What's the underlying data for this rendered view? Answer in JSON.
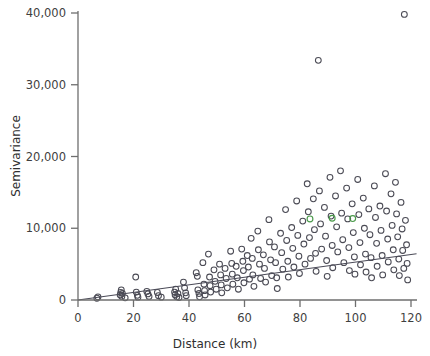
{
  "chart_data": {
    "type": "scatter",
    "title": "",
    "subtitle": "",
    "xlabel": "Distance (km)",
    "ylabel": "Semivariance",
    "xlim": [
      0,
      122
    ],
    "ylim": [
      0,
      41000
    ],
    "xticks": [
      0,
      20,
      40,
      60,
      80,
      100,
      120
    ],
    "xticklabels": [
      "0",
      "20",
      "40",
      "60",
      "80",
      "100",
      "120"
    ],
    "yticks": [
      0,
      10000,
      20000,
      30000,
      40000
    ],
    "yticklabels": [
      "0",
      "10,000",
      "20,000",
      "30,000",
      "40,000"
    ],
    "grid": false,
    "legend": null,
    "marker": "open-circle",
    "marker_size": 4.2,
    "colors": {
      "marker": "#4b4b55",
      "marker_highlight": "#4a9a4a",
      "trendline": "#4a4a57",
      "axis": "#6e6e6e",
      "text": "#3f3f3f",
      "background": "#ffffff"
    },
    "annotations": [
      {
        "label": "trend line",
        "type": "line",
        "x0": 0,
        "y0": 0,
        "x1": 122,
        "y1": 6450
      }
    ],
    "series": [
      {
        "name": "semivariance cloud",
        "color": "#4b4b55",
        "points": [
          [
            6.8,
            250
          ],
          [
            7.2,
            420
          ],
          [
            15.2,
            700
          ],
          [
            15.4,
            1050
          ],
          [
            15.6,
            1400
          ],
          [
            15.8,
            500
          ],
          [
            16.0,
            900
          ],
          [
            17.0,
            300
          ],
          [
            20.8,
            3200
          ],
          [
            21.0,
            1100
          ],
          [
            21.4,
            650
          ],
          [
            21.6,
            400
          ],
          [
            24.8,
            1200
          ],
          [
            25.2,
            850
          ],
          [
            25.6,
            500
          ],
          [
            28.6,
            1050
          ],
          [
            29.0,
            600
          ],
          [
            30.0,
            400
          ],
          [
            34.8,
            1100
          ],
          [
            35.0,
            700
          ],
          [
            35.2,
            1500
          ],
          [
            35.6,
            450
          ],
          [
            36.0,
            900
          ],
          [
            36.4,
            350
          ],
          [
            38.0,
            2500
          ],
          [
            38.4,
            1700
          ],
          [
            38.8,
            1000
          ],
          [
            39.0,
            600
          ],
          [
            42.6,
            3800
          ],
          [
            43.0,
            3300
          ],
          [
            43.2,
            1400
          ],
          [
            43.6,
            900
          ],
          [
            43.8,
            450
          ],
          [
            45.0,
            5200
          ],
          [
            45.4,
            2200
          ],
          [
            45.6,
            1300
          ],
          [
            45.8,
            700
          ],
          [
            47.0,
            6400
          ],
          [
            47.4,
            3200
          ],
          [
            47.6,
            2000
          ],
          [
            47.8,
            1100
          ],
          [
            49.0,
            4200
          ],
          [
            49.4,
            2600
          ],
          [
            49.8,
            1500
          ],
          [
            51.0,
            5000
          ],
          [
            51.4,
            3500
          ],
          [
            51.6,
            2100
          ],
          [
            51.8,
            1000
          ],
          [
            53.0,
            4400
          ],
          [
            53.4,
            3000
          ],
          [
            53.8,
            1700
          ],
          [
            55.0,
            6800
          ],
          [
            55.4,
            5100
          ],
          [
            55.6,
            3600
          ],
          [
            55.8,
            2200
          ],
          [
            57.0,
            4700
          ],
          [
            57.4,
            3100
          ],
          [
            57.8,
            1500
          ],
          [
            59.0,
            7100
          ],
          [
            59.4,
            5400
          ],
          [
            59.6,
            4100
          ],
          [
            59.8,
            2400
          ],
          [
            61.0,
            6200
          ],
          [
            61.4,
            4600
          ],
          [
            61.8,
            2900
          ],
          [
            62.4,
            8600
          ],
          [
            62.8,
            5800
          ],
          [
            63.0,
            3500
          ],
          [
            63.4,
            1900
          ],
          [
            64.8,
            9600
          ],
          [
            65.0,
            7000
          ],
          [
            65.4,
            5000
          ],
          [
            65.8,
            3000
          ],
          [
            66.8,
            6300
          ],
          [
            67.2,
            4400
          ],
          [
            67.6,
            2500
          ],
          [
            68.8,
            11200
          ],
          [
            69.0,
            8100
          ],
          [
            69.4,
            5600
          ],
          [
            69.8,
            3400
          ],
          [
            70.8,
            7400
          ],
          [
            71.2,
            5200
          ],
          [
            71.6,
            3100
          ],
          [
            71.8,
            1600
          ],
          [
            73.0,
            9300
          ],
          [
            73.4,
            6600
          ],
          [
            73.8,
            4300
          ],
          [
            74.8,
            12600
          ],
          [
            75.2,
            8300
          ],
          [
            75.6,
            5400
          ],
          [
            75.8,
            3200
          ],
          [
            77.0,
            10100
          ],
          [
            77.4,
            7200
          ],
          [
            77.8,
            4600
          ],
          [
            78.8,
            13800
          ],
          [
            79.2,
            9000
          ],
          [
            79.6,
            6100
          ],
          [
            79.8,
            3700
          ],
          [
            81.0,
            11000
          ],
          [
            81.4,
            7800
          ],
          [
            81.8,
            5000
          ],
          [
            82.6,
            16200
          ],
          [
            83.0,
            12300
          ],
          [
            83.4,
            8700
          ],
          [
            83.8,
            5800
          ],
          [
            84.8,
            14100
          ],
          [
            85.2,
            9800
          ],
          [
            85.6,
            6500
          ],
          [
            85.8,
            4000
          ],
          [
            86.6,
            33400
          ],
          [
            87.0,
            15200
          ],
          [
            87.4,
            10600
          ],
          [
            87.8,
            7100
          ],
          [
            88.8,
            12900
          ],
          [
            89.2,
            8900
          ],
          [
            89.6,
            5500
          ],
          [
            89.8,
            3300
          ],
          [
            90.8,
            17100
          ],
          [
            91.2,
            11700
          ],
          [
            91.6,
            7600
          ],
          [
            91.8,
            4500
          ],
          [
            92.8,
            14500
          ],
          [
            93.2,
            10200
          ],
          [
            93.6,
            6700
          ],
          [
            94.6,
            18000
          ],
          [
            95.0,
            12100
          ],
          [
            95.4,
            8400
          ],
          [
            95.8,
            5200
          ],
          [
            96.8,
            15600
          ],
          [
            97.2,
            11300
          ],
          [
            97.6,
            7300
          ],
          [
            97.8,
            4100
          ],
          [
            98.8,
            13400
          ],
          [
            99.2,
            9400
          ],
          [
            99.6,
            6000
          ],
          [
            99.8,
            3600
          ],
          [
            100.8,
            16800
          ],
          [
            101.2,
            11900
          ],
          [
            101.6,
            8000
          ],
          [
            101.8,
            4900
          ],
          [
            102.8,
            14200
          ],
          [
            103.2,
            10000
          ],
          [
            103.6,
            6400
          ],
          [
            103.8,
            3900
          ],
          [
            104.8,
            12700
          ],
          [
            105.2,
            9100
          ],
          [
            105.6,
            5900
          ],
          [
            105.8,
            3100
          ],
          [
            106.8,
            15900
          ],
          [
            107.2,
            11500
          ],
          [
            107.6,
            7900
          ],
          [
            107.8,
            4700
          ],
          [
            108.8,
            13100
          ],
          [
            109.2,
            9700
          ],
          [
            109.6,
            6200
          ],
          [
            109.8,
            3500
          ],
          [
            110.8,
            17600
          ],
          [
            111.2,
            12400
          ],
          [
            111.6,
            8500
          ],
          [
            111.8,
            5300
          ],
          [
            112.8,
            14800
          ],
          [
            113.2,
            10400
          ],
          [
            113.6,
            7000
          ],
          [
            113.8,
            4200
          ],
          [
            114.4,
            16400
          ],
          [
            114.8,
            12000
          ],
          [
            115.2,
            8800
          ],
          [
            115.6,
            5700
          ],
          [
            115.8,
            3400
          ],
          [
            116.4,
            13600
          ],
          [
            116.8,
            9900
          ],
          [
            117.0,
            6900
          ],
          [
            117.4,
            4400
          ],
          [
            117.6,
            39800
          ],
          [
            118.0,
            11100
          ],
          [
            118.4,
            7700
          ],
          [
            118.6,
            5100
          ],
          [
            118.8,
            2800
          ]
        ]
      },
      {
        "name": "highlighted pairs",
        "color": "#4a9a4a",
        "points": [
          [
            83.6,
            11300
          ],
          [
            91.6,
            11400
          ],
          [
            99.0,
            11350
          ]
        ]
      }
    ]
  }
}
